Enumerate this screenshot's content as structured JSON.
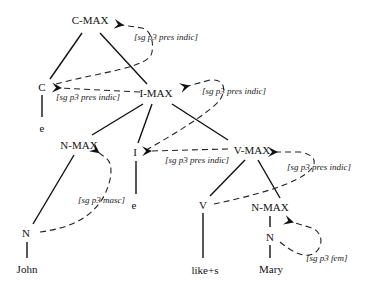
{
  "diagram": {
    "type": "syntax-tree-feature-percolation",
    "nodes": [
      {
        "id": "cmax",
        "label": "C-MAX",
        "x": 90,
        "y": 20
      },
      {
        "id": "c",
        "label": "C",
        "x": 42,
        "y": 87
      },
      {
        "id": "c_e",
        "label": "e",
        "x": 42,
        "y": 128
      },
      {
        "id": "imax",
        "label": "I-MAX",
        "x": 156,
        "y": 93
      },
      {
        "id": "nmax_l",
        "label": "N-MAX",
        "x": 79,
        "y": 145
      },
      {
        "id": "i",
        "label": "I",
        "x": 135,
        "y": 152
      },
      {
        "id": "i_e",
        "label": "e",
        "x": 134,
        "y": 205
      },
      {
        "id": "vmax",
        "label": "V-MAX",
        "x": 252,
        "y": 150
      },
      {
        "id": "v",
        "label": "V",
        "x": 203,
        "y": 205
      },
      {
        "id": "nmax_r",
        "label": "N-MAX",
        "x": 270,
        "y": 207
      },
      {
        "id": "n_r",
        "label": "N",
        "x": 270,
        "y": 237
      },
      {
        "id": "n_l",
        "label": "N",
        "x": 26,
        "y": 233
      },
      {
        "id": "john",
        "label": "John",
        "x": 27,
        "y": 269
      },
      {
        "id": "likes",
        "label": "like+s",
        "x": 205,
        "y": 270
      },
      {
        "id": "mary",
        "label": "Mary",
        "x": 271,
        "y": 269
      }
    ],
    "features": [
      {
        "id": "f_cmax",
        "text": "[sg p3 pres indic]",
        "x": 134,
        "y": 37
      },
      {
        "id": "f_c",
        "text": "[sg p3 pres indic]",
        "x": 56,
        "y": 93
      },
      {
        "id": "f_imax",
        "text": "[sg p3 pres indic]",
        "x": 202,
        "y": 87
      },
      {
        "id": "f_i",
        "text": "[sg p3 pres indic]",
        "x": 165,
        "y": 156
      },
      {
        "id": "f_vmax",
        "text": "[sg p3 pres indic]",
        "x": 287,
        "y": 163
      },
      {
        "id": "f_nmax_l",
        "text": "[sg p3 masc]",
        "x": 78,
        "y": 196
      },
      {
        "id": "f_nmax_r",
        "text": "[sg p3 fem]",
        "x": 306,
        "y": 254
      }
    ]
  }
}
